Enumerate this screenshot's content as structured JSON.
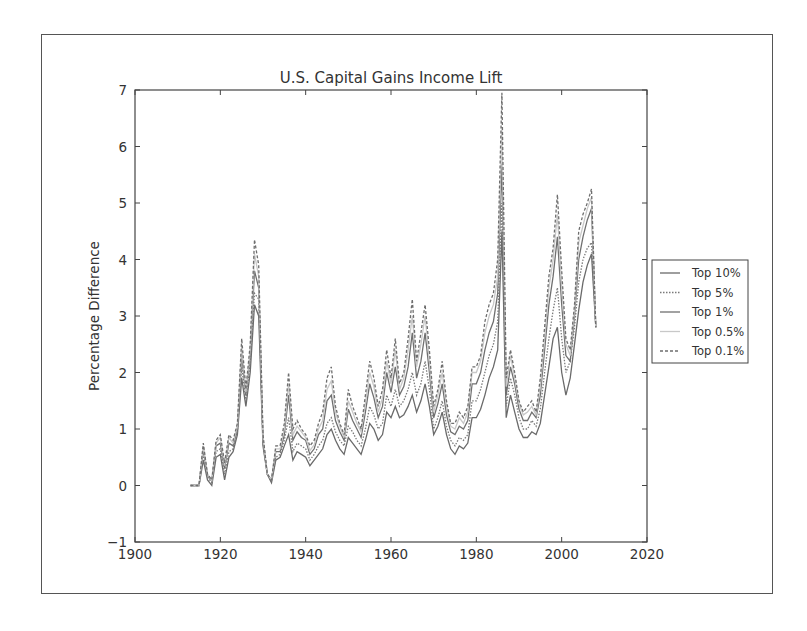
{
  "chart_data": {
    "type": "line",
    "title": "U.S. Capital Gains Income Lift",
    "xlabel": "",
    "ylabel": "Percentage Difference",
    "xlim": [
      1900,
      2020
    ],
    "ylim": [
      -1,
      7
    ],
    "xticks": [
      1900,
      1920,
      1940,
      1960,
      1980,
      2000,
      2020
    ],
    "yticks": [
      -1,
      0,
      1,
      2,
      3,
      4,
      5,
      6,
      7
    ],
    "grid": false,
    "legend_position": "right-outside",
    "x": [
      1913,
      1914,
      1915,
      1916,
      1917,
      1918,
      1919,
      1920,
      1921,
      1922,
      1923,
      1924,
      1925,
      1926,
      1927,
      1928,
      1929,
      1930,
      1931,
      1932,
      1933,
      1934,
      1935,
      1936,
      1937,
      1938,
      1939,
      1940,
      1941,
      1942,
      1943,
      1944,
      1945,
      1946,
      1947,
      1948,
      1949,
      1950,
      1951,
      1952,
      1953,
      1954,
      1955,
      1956,
      1957,
      1958,
      1959,
      1960,
      1961,
      1962,
      1963,
      1964,
      1965,
      1966,
      1967,
      1968,
      1969,
      1970,
      1971,
      1972,
      1973,
      1974,
      1975,
      1976,
      1977,
      1978,
      1979,
      1980,
      1981,
      1982,
      1983,
      1984,
      1985,
      1986,
      1987,
      1988,
      1989,
      1990,
      1991,
      1992,
      1993,
      1994,
      1995,
      1996,
      1997,
      1998,
      1999,
      2000,
      2001,
      2002,
      2003,
      2004,
      2005,
      2006,
      2007,
      2008
    ],
    "series": [
      {
        "name": "Top 10%",
        "color": "#6a6a6a",
        "dash": "solid",
        "values": [
          0,
          0,
          0,
          0.45,
          0.1,
          0,
          0.5,
          0.55,
          0.1,
          0.5,
          0.6,
          0.9,
          1.9,
          1.4,
          2.0,
          3.2,
          3.0,
          0.7,
          0.2,
          0.05,
          0.45,
          0.5,
          0.7,
          0.9,
          0.45,
          0.6,
          0.55,
          0.5,
          0.35,
          0.45,
          0.55,
          0.65,
          0.9,
          1.0,
          0.8,
          0.65,
          0.55,
          0.85,
          0.75,
          0.65,
          0.55,
          0.8,
          1.1,
          1.0,
          0.8,
          0.9,
          1.3,
          1.2,
          1.4,
          1.2,
          1.25,
          1.4,
          1.6,
          1.3,
          1.5,
          1.8,
          1.4,
          0.9,
          1.05,
          1.3,
          0.9,
          0.65,
          0.55,
          0.7,
          0.65,
          0.75,
          1.2,
          1.2,
          1.35,
          1.6,
          1.9,
          2.1,
          2.4,
          4.5,
          1.2,
          1.6,
          1.3,
          1.0,
          0.85,
          0.85,
          0.95,
          0.9,
          1.1,
          1.6,
          2.1,
          2.6,
          2.8,
          2.0,
          1.6,
          1.9,
          2.5,
          3.1,
          3.6,
          3.9,
          4.1,
          2.8
        ]
      },
      {
        "name": "Top 5%",
        "color": "#7a7a7a",
        "dash": "dotted",
        "values": [
          0,
          0,
          0,
          0.55,
          0.15,
          0.05,
          0.6,
          0.65,
          0.2,
          0.6,
          0.65,
          0.95,
          2.1,
          1.5,
          2.2,
          3.4,
          3.3,
          0.75,
          0.2,
          0.08,
          0.5,
          0.55,
          0.8,
          1.2,
          0.6,
          0.75,
          0.7,
          0.65,
          0.45,
          0.55,
          0.7,
          0.8,
          1.1,
          1.2,
          0.95,
          0.8,
          0.7,
          1.05,
          0.95,
          0.8,
          0.7,
          1.0,
          1.4,
          1.25,
          1.0,
          1.1,
          1.6,
          1.4,
          1.7,
          1.4,
          1.5,
          1.7,
          2.0,
          1.6,
          1.8,
          2.2,
          1.7,
          1.0,
          1.2,
          1.5,
          1.05,
          0.8,
          0.7,
          0.85,
          0.8,
          0.9,
          1.5,
          1.5,
          1.7,
          2.0,
          2.3,
          2.5,
          2.9,
          5.0,
          1.4,
          1.9,
          1.6,
          1.2,
          1.0,
          1.0,
          1.15,
          1.05,
          1.35,
          2.0,
          2.6,
          3.1,
          3.5,
          2.6,
          2.0,
          2.2,
          2.8,
          3.6,
          4.0,
          4.2,
          4.3,
          2.8
        ]
      },
      {
        "name": "Top 1%",
        "color": "#707070",
        "dash": "solid",
        "values": [
          0,
          0,
          0,
          0.65,
          0.18,
          0.08,
          0.7,
          0.75,
          0.3,
          0.75,
          0.7,
          1.0,
          2.3,
          1.6,
          2.3,
          3.8,
          3.5,
          0.8,
          0.2,
          0.1,
          0.6,
          0.6,
          0.9,
          1.6,
          0.8,
          0.95,
          0.85,
          0.8,
          0.55,
          0.65,
          0.9,
          1.0,
          1.5,
          1.6,
          1.15,
          0.95,
          0.8,
          1.35,
          1.15,
          1.0,
          0.85,
          1.3,
          1.8,
          1.55,
          1.2,
          1.4,
          2.0,
          1.65,
          2.1,
          1.6,
          1.75,
          2.1,
          2.7,
          1.9,
          2.2,
          2.7,
          2.0,
          1.2,
          1.45,
          1.8,
          1.25,
          0.95,
          0.9,
          1.05,
          1.0,
          1.15,
          1.8,
          1.8,
          2.0,
          2.4,
          2.7,
          2.9,
          3.4,
          5.7,
          1.6,
          2.1,
          1.8,
          1.35,
          1.15,
          1.15,
          1.3,
          1.2,
          1.6,
          2.4,
          3.2,
          3.7,
          4.4,
          3.2,
          2.3,
          2.2,
          3.0,
          4.0,
          4.4,
          4.7,
          4.9,
          2.8
        ]
      },
      {
        "name": "Top 0.5%",
        "color": "#c8c8c8",
        "dash": "solid",
        "values": [
          0,
          0,
          0,
          0.7,
          0.2,
          0.09,
          0.75,
          0.85,
          0.35,
          0.85,
          0.75,
          1.05,
          2.45,
          1.65,
          2.4,
          4.1,
          3.7,
          0.85,
          0.2,
          0.1,
          0.65,
          0.65,
          1.0,
          1.8,
          0.9,
          1.05,
          0.95,
          0.85,
          0.62,
          0.72,
          1.0,
          1.15,
          1.7,
          1.85,
          1.3,
          1.05,
          0.85,
          1.5,
          1.3,
          1.1,
          0.95,
          1.45,
          2.0,
          1.75,
          1.3,
          1.55,
          2.2,
          1.8,
          2.4,
          1.7,
          1.9,
          2.4,
          3.0,
          2.1,
          2.5,
          3.0,
          2.2,
          1.3,
          1.6,
          2.0,
          1.4,
          1.05,
          1.0,
          1.2,
          1.1,
          1.3,
          2.0,
          2.0,
          2.2,
          2.7,
          3.0,
          3.2,
          3.7,
          6.3,
          1.75,
          2.3,
          1.9,
          1.45,
          1.25,
          1.3,
          1.4,
          1.25,
          1.75,
          2.6,
          3.5,
          4.0,
          4.8,
          3.5,
          2.5,
          2.3,
          3.1,
          4.3,
          4.6,
          4.9,
          5.1,
          2.8
        ]
      },
      {
        "name": "Top 0.1%",
        "color": "#6e6e6e",
        "dash": "dashed",
        "values": [
          0,
          0,
          0,
          0.75,
          0.2,
          0.1,
          0.8,
          0.9,
          0.4,
          0.9,
          0.8,
          1.1,
          2.6,
          1.7,
          2.5,
          4.35,
          3.9,
          0.9,
          0.2,
          0.1,
          0.7,
          0.7,
          1.1,
          2.0,
          1.0,
          1.15,
          1.0,
          0.9,
          0.7,
          0.8,
          1.1,
          1.3,
          1.9,
          2.1,
          1.4,
          1.1,
          0.9,
          1.7,
          1.4,
          1.2,
          1.0,
          1.6,
          2.2,
          1.9,
          1.4,
          1.7,
          2.4,
          1.9,
          2.6,
          1.8,
          2.0,
          2.6,
          3.3,
          2.2,
          2.7,
          3.2,
          2.4,
          1.4,
          1.7,
          2.2,
          1.5,
          1.1,
          1.1,
          1.3,
          1.2,
          1.4,
          2.1,
          2.1,
          2.3,
          2.9,
          3.2,
          3.4,
          4.0,
          6.95,
          1.9,
          2.4,
          2.0,
          1.5,
          1.3,
          1.4,
          1.5,
          1.3,
          1.9,
          2.8,
          3.7,
          4.2,
          5.15,
          3.8,
          2.6,
          2.4,
          3.2,
          4.5,
          4.8,
          5.0,
          5.25,
          2.8
        ]
      }
    ]
  },
  "legend": {
    "items": [
      "Top 10%",
      "Top 5%",
      "Top 1%",
      "Top 0.5%",
      "Top 0.1%"
    ]
  }
}
